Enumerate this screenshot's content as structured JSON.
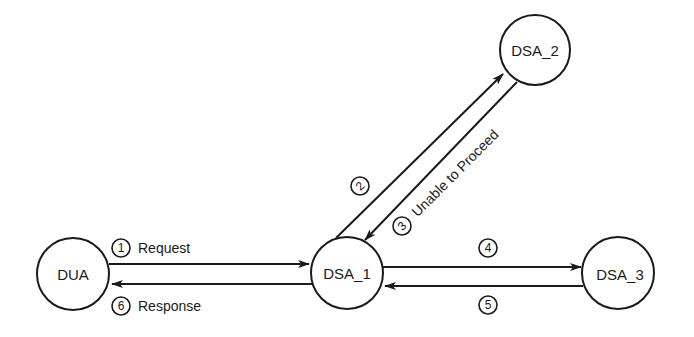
{
  "diagram": {
    "type": "directory-chaining-referral",
    "nodes": [
      {
        "id": "dua",
        "label": "DUA",
        "cx": 73,
        "cy": 274,
        "r": 36
      },
      {
        "id": "dsa1",
        "label": "DSA_1",
        "cx": 347,
        "cy": 272,
        "r": 36
      },
      {
        "id": "dsa2",
        "label": "DSA_2",
        "cx": 535,
        "cy": 50,
        "r": 35
      },
      {
        "id": "dsa3",
        "label": "DSA_3",
        "cx": 618,
        "cy": 273,
        "r": 36
      }
    ],
    "edges": [
      {
        "step": "1",
        "from": "DUA",
        "to": "DSA_1",
        "label": "Request"
      },
      {
        "step": "2",
        "from": "DSA_1",
        "to": "DSA_2",
        "label": ""
      },
      {
        "step": "3",
        "from": "DSA_2",
        "to": "DSA_1",
        "label": "Unable to Proceed"
      },
      {
        "step": "4",
        "from": "DSA_1",
        "to": "DSA_3",
        "label": ""
      },
      {
        "step": "5",
        "from": "DSA_3",
        "to": "DSA_1",
        "label": ""
      },
      {
        "step": "6",
        "from": "DSA_1",
        "to": "DUA",
        "label": "Response"
      }
    ]
  },
  "labels": {
    "dua": "DUA",
    "dsa1": "DSA_1",
    "dsa2": "DSA_2",
    "dsa3": "DSA_3",
    "step1": "1",
    "step2": "2",
    "step3": "3",
    "step4": "4",
    "step5": "5",
    "step6": "6",
    "request": "Request",
    "response": "Response",
    "unable": "Unable to Proceed"
  }
}
